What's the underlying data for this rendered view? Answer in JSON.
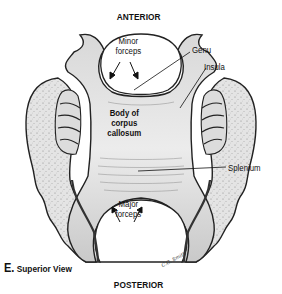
{
  "figure": {
    "panel_letter": "E.",
    "view_title": "Superior View",
    "orientation": {
      "top": "ANTERIOR",
      "bottom": "POSTERIOR"
    },
    "labels": {
      "minor_forceps": [
        "Minor",
        "forceps"
      ],
      "genu": "Genu",
      "insula": "Insula",
      "body": [
        "Body of",
        "corpus",
        "callosum"
      ],
      "splenium": "Splenium",
      "major_forceps": [
        "Major",
        "forceps"
      ]
    },
    "artist_signature": "C.G. Smith",
    "colors": {
      "background": "#ffffff",
      "ink": "#111111",
      "tissue_fill": "#e2e2e2",
      "tissue_dark": "#9a9a9a"
    }
  }
}
